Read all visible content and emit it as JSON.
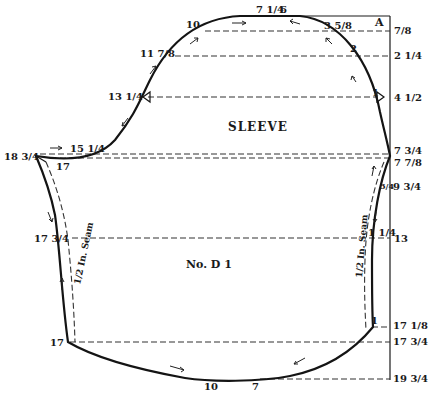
{
  "diagram": {
    "title": "SLEEVE",
    "pattern_id": "No. D 1",
    "corner_label": "A",
    "seam_label_left": "1/2 In. Seam",
    "seam_label_right": "1/2 In. Seam",
    "right_scale": [
      "7/8",
      "2 1/4",
      "4 1/2",
      "7 3/4",
      "7 7/8",
      "9 3/4",
      "13",
      "17 1/8",
      "17 3/4",
      "19 3/4"
    ],
    "top_curve_labels": [
      "10",
      "7 1/4",
      "6",
      "3 5/8",
      "2",
      "1"
    ],
    "left_cap_labels": [
      "11 7/8",
      "13 1/4",
      "15 1/4",
      "18 3/4",
      "17"
    ],
    "left_side_labels": [
      "17 3/4",
      "17"
    ],
    "right_side_labels": [
      "3/4",
      "1 1/4",
      "1"
    ],
    "bottom_labels": [
      "10",
      "7"
    ]
  }
}
